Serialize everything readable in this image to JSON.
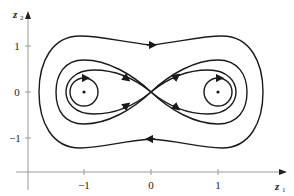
{
  "diagram": {
    "type": "phase-portrait",
    "x_axis": {
      "label": "z",
      "subscript": "1",
      "ticks": [
        "−1",
        "0",
        "1"
      ]
    },
    "y_axis": {
      "label": "z",
      "subscript": "2",
      "ticks": [
        "1",
        "0",
        "−1"
      ]
    },
    "equilibria": [
      {
        "name": "center-left",
        "z1": -1,
        "z2": 0,
        "type": "center"
      },
      {
        "name": "saddle",
        "z1": 0,
        "z2": 0,
        "type": "saddle"
      },
      {
        "name": "center-right",
        "z1": 1,
        "z2": 0,
        "type": "center"
      }
    ],
    "trajectories": [
      "outer closed orbit enclosing all equilibria (clockwise)",
      "middle closed orbit enclosing all equilibria (clockwise)",
      "figure-eight separatrix (homoclinic orbits through saddle)",
      "small closed orbit around left center",
      "small closed orbit around right center"
    ],
    "colors": {
      "curve": "#1a1a1a",
      "axis": "#9a9a9a"
    }
  }
}
